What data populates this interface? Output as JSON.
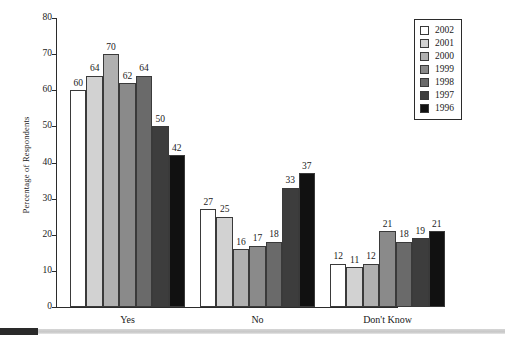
{
  "chart_data": {
    "type": "bar",
    "title": "",
    "xlabel": "",
    "ylabel": "Percentage of Respondents",
    "ylim": [
      0,
      80
    ],
    "yticks": [
      0,
      10,
      20,
      30,
      40,
      50,
      60,
      70,
      80
    ],
    "grid": false,
    "legend_position": "top-right",
    "categories": [
      "Yes",
      "No",
      "Don't Know"
    ],
    "series": [
      {
        "name": "2002",
        "color": "#ffffff",
        "values": [
          60,
          27,
          12
        ]
      },
      {
        "name": "2001",
        "color": "#d2d2d2",
        "values": [
          64,
          25,
          11
        ]
      },
      {
        "name": "2000",
        "color": "#b0b0b0",
        "values": [
          70,
          16,
          12
        ]
      },
      {
        "name": "1999",
        "color": "#8a8a8a",
        "values": [
          62,
          17,
          21
        ]
      },
      {
        "name": "1998",
        "color": "#6a6a6a",
        "values": [
          64,
          18,
          18
        ]
      },
      {
        "name": "1997",
        "color": "#3d3d3d",
        "values": [
          50,
          33,
          19
        ]
      },
      {
        "name": "1996",
        "color": "#111111",
        "values": [
          42,
          37,
          21
        ]
      }
    ]
  },
  "footer": {
    "block_color": "#2a2a2a",
    "bar_color": "#cccccc"
  }
}
